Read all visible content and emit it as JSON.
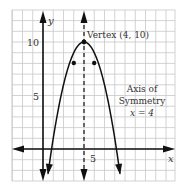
{
  "chart_data": {
    "type": "line",
    "title": "",
    "xlabel": "x",
    "ylabel": "y",
    "function": "y = -(x - 4)^2 + 10",
    "xlim": [
      -3,
      12.5
    ],
    "ylim": [
      -3,
      13
    ],
    "grid": true,
    "x_tick_labels": [
      {
        "value": 5,
        "label": "5"
      }
    ],
    "y_tick_labels": [
      {
        "value": 5,
        "label": "5"
      },
      {
        "value": 10,
        "label": "10"
      }
    ],
    "series": [
      {
        "name": "parabola",
        "x": [
          0.4,
          1,
          2,
          3,
          4,
          5,
          6,
          7,
          7.6
        ],
        "values": [
          -2.96,
          1,
          6,
          9,
          10,
          9,
          6,
          1,
          -2.96
        ]
      }
    ],
    "marked_points": [
      {
        "x": 3,
        "y": 9
      },
      {
        "x": 4,
        "y": 10
      },
      {
        "x": 5,
        "y": 9
      }
    ],
    "annotations": [
      {
        "text": "Vertex (4, 10)",
        "x": 4,
        "y": 10
      },
      {
        "text": "Axis of",
        "line": 1
      },
      {
        "text": "Symmetry",
        "line": 2
      },
      {
        "text": "x = 4",
        "line": 3
      }
    ],
    "axis_of_symmetry": {
      "x": 4,
      "style": "dashed"
    }
  },
  "labels": {
    "x_axis": "x",
    "y_axis": "y",
    "tick_x5": "5",
    "tick_y5": "5",
    "tick_y10": "10",
    "vertex": "Vertex (4, 10)",
    "axis_line1": "Axis of",
    "axis_line2": "Symmetry",
    "axis_line3": "x = 4"
  }
}
